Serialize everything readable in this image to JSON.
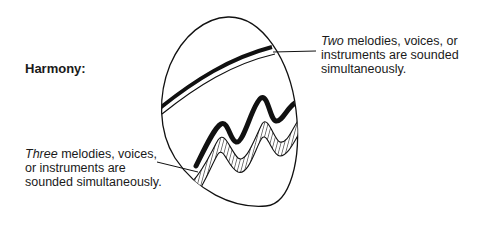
{
  "title": "Harmony:",
  "captions": {
    "two": {
      "emphasis": "Two",
      "rest_line1": " melodies, voices, or",
      "line2": "instruments are sounded",
      "line3": "simultaneously."
    },
    "three": {
      "emphasis": "Three",
      "rest_line1": " melodies, voices,",
      "line2": "or instruments are",
      "line3": "sounded simultaneously."
    }
  },
  "illustration": {
    "shape": "egg-icon",
    "bands": [
      "two-line-band",
      "three-line-wave-band"
    ],
    "colors": {
      "stroke": "#111111",
      "background": "#ffffff"
    }
  }
}
